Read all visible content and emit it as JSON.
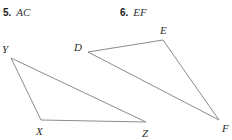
{
  "page": {
    "background_color": "#ffffff",
    "width": 232,
    "height": 140
  },
  "prompts": [
    {
      "number": "5.",
      "segment": "AC"
    },
    {
      "number": "6.",
      "segment": "EF"
    }
  ],
  "figure": {
    "stroke_color": "#8c8c8c",
    "stroke_width": 1,
    "shapes": [
      {
        "name": "triangle-xyz",
        "vertices": [
          {
            "label": "Y",
            "x": 11,
            "y": 58,
            "label_x": 2,
            "label_y": 44
          },
          {
            "label": "X",
            "x": 41,
            "y": 120,
            "label_x": 36,
            "label_y": 126
          },
          {
            "label": "Z",
            "x": 146,
            "y": 122,
            "label_x": 142,
            "label_y": 128
          }
        ]
      },
      {
        "name": "triangle-def",
        "vertices": [
          {
            "label": "D",
            "x": 88,
            "y": 52,
            "label_x": 74,
            "label_y": 42
          },
          {
            "label": "E",
            "x": 163,
            "y": 40,
            "label_x": 160,
            "label_y": 25
          },
          {
            "label": "F",
            "x": 219,
            "y": 120,
            "label_x": 222,
            "label_y": 123
          }
        ]
      }
    ]
  }
}
